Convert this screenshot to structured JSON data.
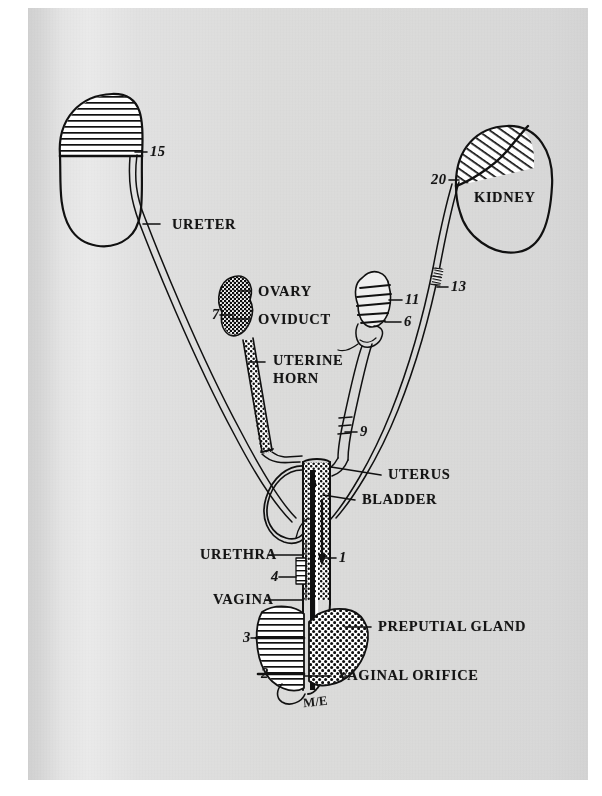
{
  "figure": {
    "signature": "M/E",
    "paper_color": "#dedede",
    "ink_color": "#111111"
  },
  "labels": {
    "terms": [
      {
        "id": "ureter",
        "text": "URETER",
        "x": 172,
        "y": 228,
        "leader": {
          "x1": 160,
          "y1": 224,
          "x2": 143,
          "y2": 224
        }
      },
      {
        "id": "kidney",
        "text": "KIDNEY",
        "x": 474,
        "y": 201,
        "leader": null
      },
      {
        "id": "ovary",
        "text": "OVARY",
        "x": 258,
        "y": 295,
        "leader": {
          "x1": 250,
          "y1": 291,
          "x2": 238,
          "y2": 291
        }
      },
      {
        "id": "oviduct",
        "text": "OVIDUCT",
        "x": 258,
        "y": 323,
        "leader": {
          "x1": 250,
          "y1": 319,
          "x2": 231,
          "y2": 319
        }
      },
      {
        "id": "uterine-horn",
        "text": "UTERINE",
        "x": 273,
        "y": 364,
        "leader": {
          "x1": 265,
          "y1": 362,
          "x2": 249,
          "y2": 362
        }
      },
      {
        "id": "uterine-horn-2",
        "text": "HORN",
        "x": 273,
        "y": 382,
        "leader": null
      },
      {
        "id": "uterus",
        "text": "UTERUS",
        "x": 388,
        "y": 478,
        "leader": {
          "x1": 381,
          "y1": 475,
          "x2": 331,
          "y2": 467
        }
      },
      {
        "id": "bladder",
        "text": "BLADDER",
        "x": 362,
        "y": 503,
        "leader": {
          "x1": 355,
          "y1": 500,
          "x2": 323,
          "y2": 495
        }
      },
      {
        "id": "urethra",
        "text": "URETHRA",
        "x": 200,
        "y": 558,
        "leader": {
          "x1": 268,
          "y1": 555,
          "x2": 303,
          "y2": 555
        }
      },
      {
        "id": "vagina",
        "text": "VAGINA",
        "x": 213,
        "y": 603,
        "leader": {
          "x1": 265,
          "y1": 600,
          "x2": 302,
          "y2": 600
        }
      },
      {
        "id": "preputial-gland",
        "text": "PREPUTIAL GLAND",
        "x": 378,
        "y": 630,
        "leader": {
          "x1": 371,
          "y1": 627,
          "x2": 345,
          "y2": 627
        }
      },
      {
        "id": "vaginal-orifice",
        "text": "VAGINAL ORIFICE",
        "x": 338,
        "y": 679,
        "leader": {
          "x1": 331,
          "y1": 676,
          "x2": 305,
          "y2": 676
        }
      }
    ],
    "numbers": [
      {
        "id": "n15",
        "text": "15",
        "x": 150,
        "y": 155,
        "leader": {
          "x1": 147,
          "y1": 152,
          "x2": 135,
          "y2": 152
        }
      },
      {
        "id": "n20",
        "text": "20",
        "x": 431,
        "y": 183,
        "leader": {
          "x1": 449,
          "y1": 180,
          "x2": 459,
          "y2": 180
        }
      },
      {
        "id": "n13",
        "text": "13",
        "x": 451,
        "y": 290,
        "leader": {
          "x1": 448,
          "y1": 287,
          "x2": 437,
          "y2": 287
        }
      },
      {
        "id": "n7",
        "text": "7",
        "x": 212,
        "y": 318,
        "leader": {
          "x1": 220,
          "y1": 315,
          "x2": 233,
          "y2": 315
        }
      },
      {
        "id": "n11",
        "text": "11",
        "x": 405,
        "y": 303,
        "leader": {
          "x1": 402,
          "y1": 300,
          "x2": 389,
          "y2": 300
        }
      },
      {
        "id": "n6",
        "text": "6",
        "x": 404,
        "y": 325,
        "leader": {
          "x1": 401,
          "y1": 322,
          "x2": 385,
          "y2": 322
        }
      },
      {
        "id": "n9",
        "text": "9",
        "x": 360,
        "y": 435,
        "leader": {
          "x1": 357,
          "y1": 432,
          "x2": 345,
          "y2": 432
        }
      },
      {
        "id": "n1",
        "text": "1",
        "x": 339,
        "y": 561,
        "leader": {
          "x1": 336,
          "y1": 558,
          "x2": 320,
          "y2": 558
        }
      },
      {
        "id": "n4",
        "text": "4",
        "x": 271,
        "y": 580,
        "leader": {
          "x1": 279,
          "y1": 577,
          "x2": 296,
          "y2": 577
        }
      },
      {
        "id": "n3",
        "text": "3",
        "x": 243,
        "y": 641,
        "leader": {
          "x1": 251,
          "y1": 638,
          "x2": 268,
          "y2": 638
        }
      },
      {
        "id": "n2",
        "text": "2",
        "x": 261,
        "y": 677,
        "leader": {
          "x1": 269,
          "y1": 674,
          "x2": 284,
          "y2": 674
        }
      }
    ]
  },
  "structures": {
    "left_kidney": {
      "name": "left-kidney",
      "shading": "horizontal-lines"
    },
    "right_kidney": {
      "name": "right-kidney",
      "shading": "diagonal-lines"
    },
    "left_ovary": {
      "name": "left-ovary",
      "shading": "stipple-coarse"
    },
    "right_ovary": {
      "name": "right-ovary",
      "shading": "horizontal-bands"
    },
    "uterus_body": {
      "name": "uterus-body",
      "shading": "stipple"
    },
    "preputial_gland": {
      "name": "preputial-gland",
      "shading": "dot-grid"
    },
    "vulva": {
      "name": "vulva",
      "shading": "horizontal-lines"
    }
  }
}
